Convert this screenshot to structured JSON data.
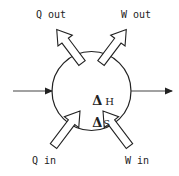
{
  "diagram": {
    "type": "thermodynamic-system",
    "labels": {
      "q_out": "Q out",
      "w_out": "W out",
      "q_in": "Q in",
      "w_in": "W in"
    },
    "state_functions": [
      {
        "symbol": "Δ",
        "variable": "H"
      },
      {
        "symbol": "Δ",
        "variable": "S"
      }
    ],
    "flows": {
      "mass_in": "left horizontal arrow into system",
      "mass_out": "right horizontal arrow out of system"
    },
    "colors": {
      "stroke": "#222222",
      "fill": "#ffffff"
    }
  }
}
